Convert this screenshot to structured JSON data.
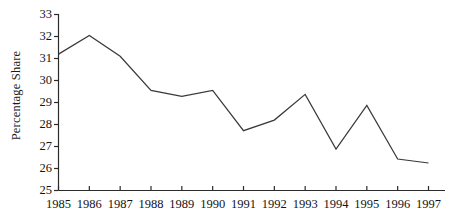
{
  "chart_data": {
    "type": "line",
    "title": "",
    "subtitle": "",
    "xlabel": "",
    "ylabel": "Percentage Share",
    "categories": [
      "1985",
      "1986",
      "1987",
      "1988",
      "1989",
      "1990",
      "1991",
      "1992",
      "1993",
      "1994",
      "1995",
      "1996",
      "1997"
    ],
    "x": [
      1985,
      1986,
      1987,
      1988,
      1989,
      1990,
      1991,
      1992,
      1993,
      1994,
      1995,
      1996,
      1997
    ],
    "values": [
      31.2,
      32.05,
      31.1,
      29.55,
      29.28,
      29.55,
      27.72,
      28.2,
      29.37,
      26.88,
      28.87,
      26.43,
      26.25
    ],
    "series": [
      {
        "name": "Percentage Share",
        "values": [
          31.2,
          32.05,
          31.1,
          29.55,
          29.28,
          29.55,
          27.72,
          28.2,
          29.37,
          26.88,
          28.87,
          26.43,
          26.25
        ]
      }
    ],
    "ylim": [
      25,
      33
    ],
    "xlim": [
      1985,
      1997
    ],
    "yticks": [
      25,
      26,
      27,
      28,
      29,
      30,
      31,
      32,
      33
    ],
    "ytick_labels": [
      "25",
      "26",
      "27",
      "28",
      "29",
      "30",
      "31",
      "32",
      "33"
    ],
    "xticks": [
      1985,
      1986,
      1987,
      1988,
      1989,
      1990,
      1991,
      1992,
      1993,
      1994,
      1995,
      1996,
      1997
    ],
    "xtick_labels": [
      "1985",
      "1986",
      "1987",
      "1988",
      "1989",
      "1990",
      "1991",
      "1992",
      "1993",
      "1994",
      "1995",
      "1996",
      "1997"
    ],
    "grid": false,
    "legend": false,
    "legend_position": "none",
    "annotations": [],
    "line_color": "#3a3a3a",
    "axis_color": "#2b2b2b",
    "background_color": "#ffffff"
  }
}
